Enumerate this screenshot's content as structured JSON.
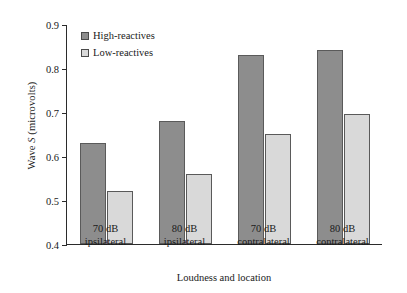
{
  "chart_data": {
    "type": "bar",
    "title": "",
    "xlabel": "Loudness and location",
    "ylabel_prefix": "Wave ",
    "ylabel_italic": "S",
    "ylabel_suffix": " (microvolts)",
    "categories": [
      {
        "line1": "70 dB",
        "line2": "ipsilateral"
      },
      {
        "line1": "80 dB",
        "line2": "ipsilateral"
      },
      {
        "line1": "70 dB",
        "line2": "contralateral"
      },
      {
        "line1": "80 dB",
        "line2": "contralateral"
      }
    ],
    "series": [
      {
        "name": "High-reactives",
        "color": "#8d8d8d",
        "values": [
          0.63,
          0.68,
          0.83,
          0.84
        ]
      },
      {
        "name": "Low-reactives",
        "color": "#d9d9d9",
        "values": [
          0.52,
          0.56,
          0.65,
          0.695
        ]
      }
    ],
    "ylim": [
      0.4,
      0.9
    ],
    "yticks": [
      "0.9",
      "0.8",
      "0.7",
      "0.6",
      "0.5",
      "0.4"
    ],
    "ytick_values": [
      0.9,
      0.8,
      0.7,
      0.6,
      0.5,
      0.4
    ],
    "grid": false,
    "legend_position": "top-left-inside",
    "axis_color": "#2b2b2b",
    "bar_edge_color": "#5a5a5a"
  }
}
